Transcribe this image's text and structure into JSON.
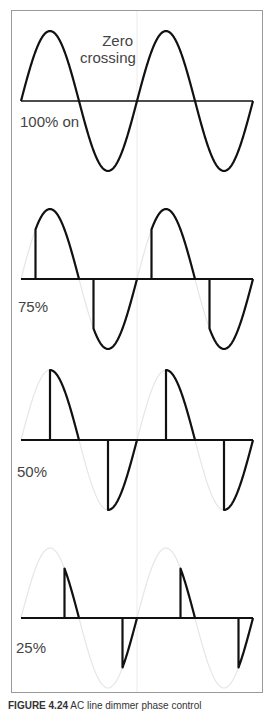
{
  "figure": {
    "caption_prefix": "FIGURE 4.24",
    "caption_text": "AC line dimmer phase control"
  },
  "annotation": {
    "line1": "Zero",
    "line2": "crossing"
  },
  "panels": [
    {
      "label": "100% on",
      "duty_percent": 100
    },
    {
      "label": "75%",
      "duty_percent": 75
    },
    {
      "label": "50%",
      "duty_percent": 50
    },
    {
      "label": "25%",
      "duty_percent": 25
    }
  ],
  "colors": {
    "waveform": "#111111",
    "ghost": "#e6e6e6",
    "frame": "#9a9a9a",
    "text": "#444444"
  }
}
